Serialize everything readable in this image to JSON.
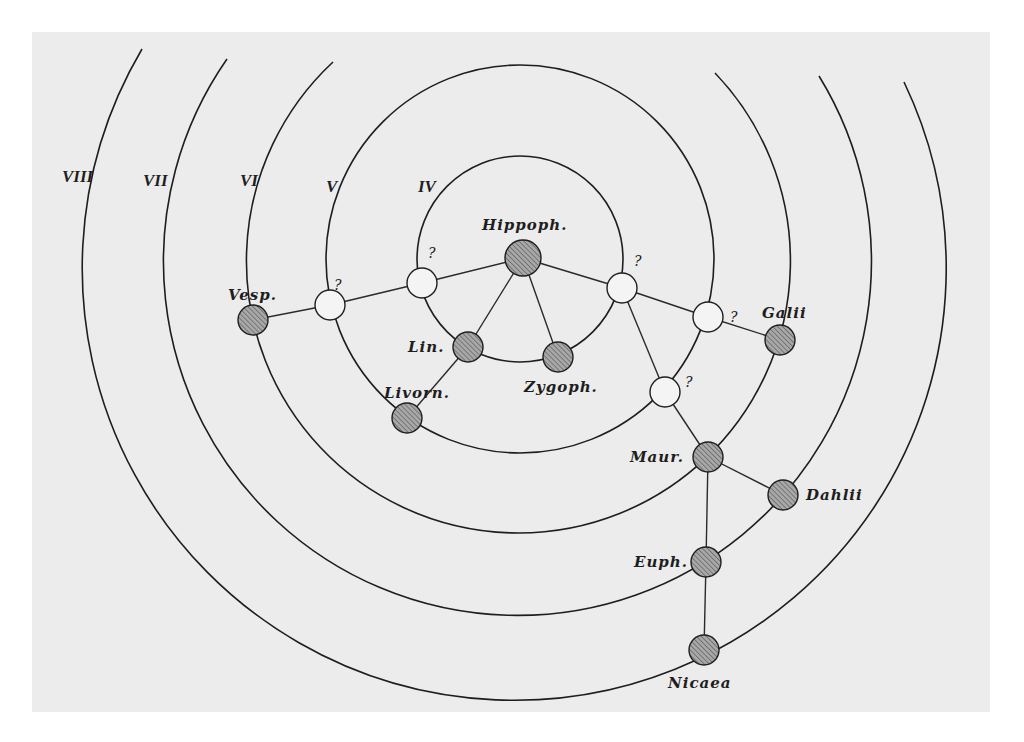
{
  "diagram": {
    "center": [
      520,
      259
    ],
    "rings": [
      {
        "id": "IV",
        "label": "IV",
        "r": 103,
        "full": true,
        "label_pos": [
          418,
          192
        ]
      },
      {
        "id": "V",
        "label": "V",
        "r": 194,
        "full": true,
        "label_pos": [
          326,
          192
        ]
      },
      {
        "id": "VI",
        "label": "VI",
        "r": 272,
        "full": false,
        "start": [
          333,
          62
        ],
        "end": [
          715,
          73
        ],
        "label_pos": [
          240,
          186
        ]
      },
      {
        "id": "VII",
        "label": "VII",
        "r": 354,
        "full": false,
        "start": [
          227,
          59
        ],
        "end": [
          819,
          76
        ],
        "label_pos": [
          143,
          186
        ]
      },
      {
        "id": "VIII",
        "label": "VIII",
        "r": 432,
        "full": false,
        "start": [
          142,
          49
        ],
        "end": [
          904,
          82
        ],
        "label_pos": [
          62,
          182
        ]
      }
    ],
    "nodes": [
      {
        "id": "hippoph",
        "label": "Hippoph.",
        "type": "known",
        "x": 523,
        "y": 258,
        "lx": 482,
        "ly": 230
      },
      {
        "id": "lin",
        "label": "Lin.",
        "type": "known",
        "x": 468,
        "y": 347,
        "lx": 408,
        "ly": 352
      },
      {
        "id": "zygoph",
        "label": "Zygoph.",
        "type": "known",
        "x": 558,
        "y": 357,
        "lx": 524,
        "ly": 392
      },
      {
        "id": "livorn",
        "label": "Livorn.",
        "type": "known",
        "x": 407,
        "y": 418,
        "lx": 384,
        "ly": 398
      },
      {
        "id": "vesp",
        "label": "Vesp.",
        "type": "known",
        "x": 253,
        "y": 320,
        "lx": 228,
        "ly": 300
      },
      {
        "id": "galii",
        "label": "Galii",
        "type": "known",
        "x": 780,
        "y": 340,
        "lx": 762,
        "ly": 318
      },
      {
        "id": "maur",
        "label": "Maur.",
        "type": "known",
        "x": 708,
        "y": 457,
        "lx": 630,
        "ly": 462
      },
      {
        "id": "dahlii",
        "label": "Dahlii",
        "type": "known",
        "x": 783,
        "y": 495,
        "lx": 806,
        "ly": 500
      },
      {
        "id": "euph",
        "label": "Euph.",
        "type": "known",
        "x": 706,
        "y": 562,
        "lx": 634,
        "ly": 567
      },
      {
        "id": "nicaea",
        "label": "Nicaea",
        "type": "known",
        "x": 704,
        "y": 650,
        "lx": 668,
        "ly": 688
      },
      {
        "id": "q1",
        "label": "?",
        "type": "unknown",
        "x": 422,
        "y": 283,
        "lx": 428,
        "ly": 258
      },
      {
        "id": "q2",
        "label": "?",
        "type": "unknown",
        "x": 330,
        "y": 305,
        "lx": 334,
        "ly": 290
      },
      {
        "id": "q3",
        "label": "?",
        "type": "unknown",
        "x": 622,
        "y": 288,
        "lx": 634,
        "ly": 266
      },
      {
        "id": "q4",
        "label": "?",
        "type": "unknown",
        "x": 708,
        "y": 317,
        "lx": 730,
        "ly": 322
      },
      {
        "id": "q5",
        "label": "?",
        "type": "unknown",
        "x": 665,
        "y": 392,
        "lx": 685,
        "ly": 387
      }
    ],
    "edges": [
      [
        "hippoph",
        "q1"
      ],
      [
        "q1",
        "q2"
      ],
      [
        "q2",
        "vesp"
      ],
      [
        "hippoph",
        "lin"
      ],
      [
        "hippoph",
        "zygoph"
      ],
      [
        "lin",
        "livorn"
      ],
      [
        "hippoph",
        "q3"
      ],
      [
        "q3",
        "q4"
      ],
      [
        "q4",
        "galii"
      ],
      [
        "q3",
        "q5"
      ],
      [
        "q5",
        "maur"
      ],
      [
        "maur",
        "dahlii"
      ],
      [
        "maur",
        "euph"
      ],
      [
        "euph",
        "nicaea"
      ]
    ]
  }
}
